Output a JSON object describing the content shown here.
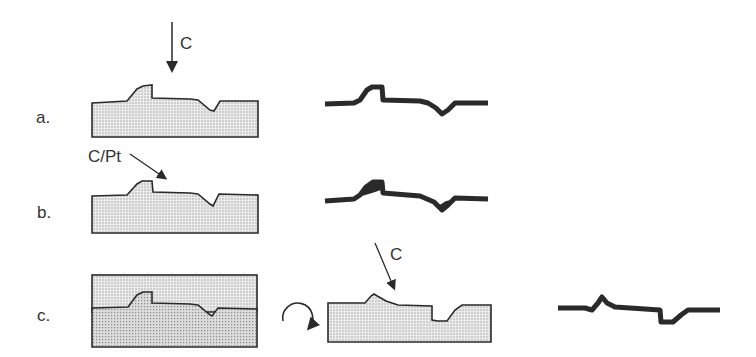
{
  "rows": [
    {
      "id": "a",
      "label": "a.",
      "arrow_label": "C"
    },
    {
      "id": "b",
      "label": "b.",
      "arrow_label": "C/Pt"
    },
    {
      "id": "c",
      "label": "c.",
      "arrow_label": "C"
    }
  ],
  "icons": {
    "rotate": "rotate-arrow-icon"
  },
  "colors": {
    "stroke": "#2a2a2a",
    "fill_light": "#e2e2e2",
    "fill_dark": "#cfcfcf",
    "replica": "#2a2a2a"
  }
}
